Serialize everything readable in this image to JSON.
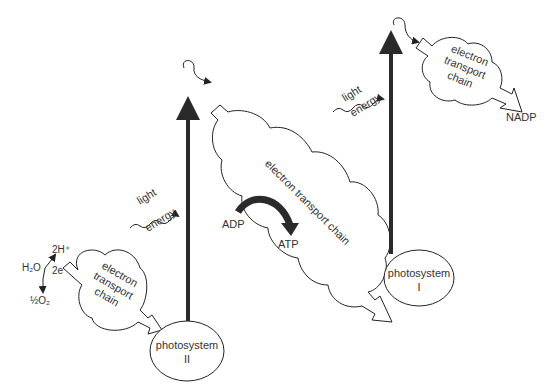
{
  "diagram": {
    "water_split": {
      "reactant": "H₂O",
      "protons": "2H⁺",
      "electrons": "2e⁻",
      "oxygen": "½O₂"
    },
    "etc_left": {
      "line1": "electron",
      "line2": "transport",
      "line3": "chain"
    },
    "photosystem_2": {
      "line1": "photosystem",
      "line2": "II"
    },
    "light_left": {
      "line1": "light",
      "line2": "energy"
    },
    "etc_middle": {
      "label": "electron transport chain"
    },
    "atp": {
      "input": "ADP",
      "output": "ATP"
    },
    "photosystem_1": {
      "line1": "photosystem",
      "line2": "I"
    },
    "light_right": {
      "line1": "light",
      "line2": "energy"
    },
    "etc_right": {
      "line1": "electron",
      "line2": "transport",
      "line3": "chain"
    },
    "nadp": {
      "label": "NADP"
    }
  }
}
